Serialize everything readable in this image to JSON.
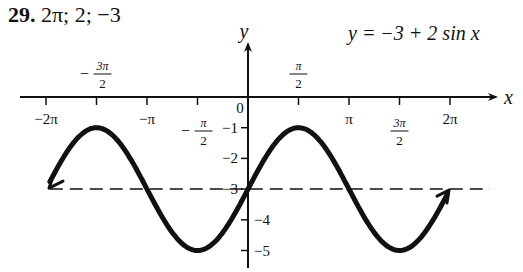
{
  "header": {
    "problem_number": "29.",
    "answer": "2π; 2; −3"
  },
  "equation": "y = −3 + 2 sin x",
  "chart_data": {
    "type": "line",
    "title": "y = −3 + 2 sin x",
    "subtitle": "Period 2π; Amplitude 2; Vertical shift −3",
    "xlabel": "x",
    "ylabel": "y",
    "x_ticks": [
      {
        "value": -6.2832,
        "label": "−2π"
      },
      {
        "value": -4.7124,
        "label": "−3π/2"
      },
      {
        "value": -3.1416,
        "label": "−π"
      },
      {
        "value": -1.5708,
        "label": "−π/2"
      },
      {
        "value": 0,
        "label": "0"
      },
      {
        "value": 1.5708,
        "label": "π/2"
      },
      {
        "value": 3.1416,
        "label": "π"
      },
      {
        "value": 4.7124,
        "label": "3π/2"
      },
      {
        "value": 6.2832,
        "label": "2π"
      }
    ],
    "y_ticks": [
      {
        "value": -1,
        "label": "−1"
      },
      {
        "value": -2,
        "label": "−2"
      },
      {
        "value": -3,
        "label": "−3"
      },
      {
        "value": -4,
        "label": "−4"
      },
      {
        "value": -5,
        "label": "−5"
      }
    ],
    "series": [
      {
        "name": "y = −3 + 2 sin x",
        "x": [
          -6.2832,
          -4.7124,
          -3.1416,
          -1.5708,
          0,
          1.5708,
          3.1416,
          4.7124,
          6.2832
        ],
        "y": [
          -3,
          -1,
          -3,
          -5,
          -3,
          -1,
          -3,
          -5,
          -3
        ],
        "style": "solid-thick",
        "arrows": "both-ends"
      },
      {
        "name": "midline y = −3",
        "x": [
          -6.6,
          7.3
        ],
        "y": [
          -3,
          -3
        ],
        "style": "dashed"
      }
    ],
    "xlim": [
      -6.6,
      7.3
    ],
    "ylim": [
      -5.6,
      1.5
    ],
    "grid": false,
    "legend": "none"
  }
}
